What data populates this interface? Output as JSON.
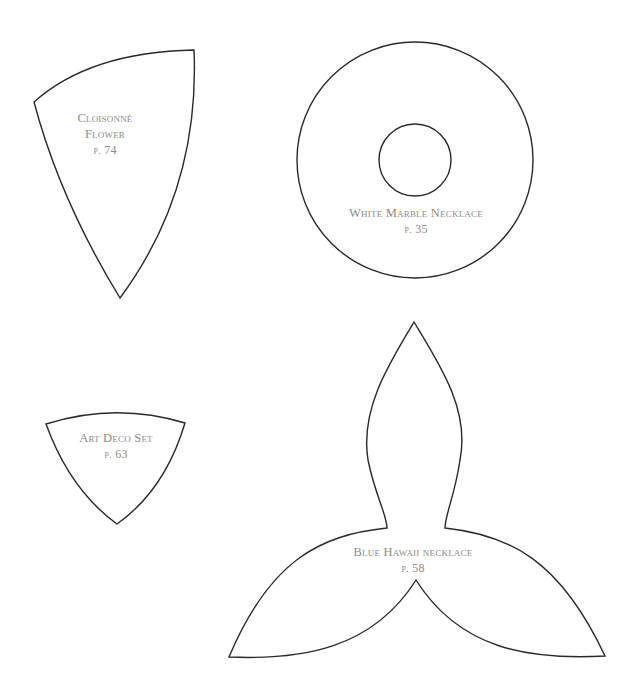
{
  "page": {
    "background": "#ffffff",
    "stroke_color": "#2a2a2a",
    "label_color": "#8c8c8c"
  },
  "templates": [
    {
      "id": "cloisonne-flower",
      "shape": "curved-wedge",
      "title_lines": [
        "Cloisonné",
        "Flower"
      ],
      "page_prefix": "p.",
      "page_number": "74"
    },
    {
      "id": "white-marble-necklace",
      "shape": "ring",
      "title_lines": [
        "White Marble Necklace"
      ],
      "page_prefix": "p.",
      "page_number": "35"
    },
    {
      "id": "art-deco-set",
      "shape": "rounded-triangle",
      "title_lines": [
        "Art Deco Set"
      ],
      "page_prefix": "p.",
      "page_number": "63"
    },
    {
      "id": "blue-hawaii-necklace",
      "shape": "three-petal",
      "title_lines": [
        "Blue Hawaii necklace"
      ],
      "page_prefix": "p.",
      "page_number": "58"
    }
  ]
}
